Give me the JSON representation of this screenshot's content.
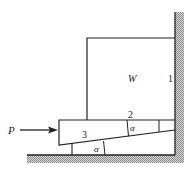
{
  "diagram": {
    "labels": {
      "block": "W",
      "wall_contact": "1",
      "block_wedge_contact": "2",
      "wedge": "3",
      "angle_upper": "α",
      "angle_lower": "α",
      "force": "P"
    },
    "colors": {
      "line": "#222222",
      "hatch": "#9a9a9a",
      "background": "#ffffff"
    }
  }
}
